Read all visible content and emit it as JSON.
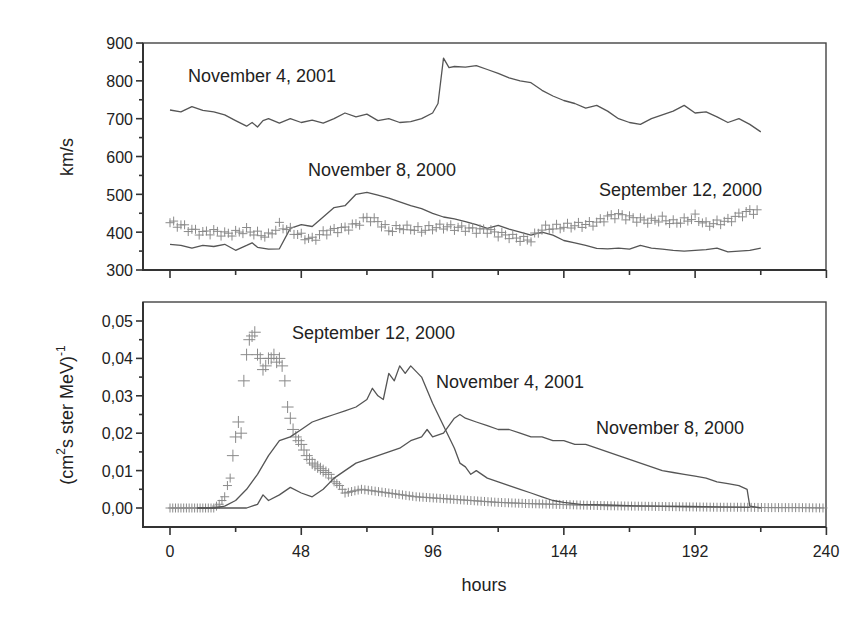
{
  "chart_data": [
    {
      "type": "line",
      "panel": "top",
      "title": "",
      "xlabel": "",
      "ylabel": "km/s",
      "xlim": [
        -6,
        240
      ],
      "ylim": [
        300,
        900
      ],
      "xticks": [
        0,
        24,
        48,
        72,
        96,
        120,
        144,
        168,
        192,
        216,
        240
      ],
      "xtick_labels_visible": false,
      "yticks": [
        300,
        400,
        500,
        600,
        700,
        800,
        900
      ],
      "ytick_labels": [
        "300",
        "400",
        "500",
        "600",
        "700",
        "800",
        "900"
      ],
      "grid": false,
      "annotations": [
        {
          "text": "November 4, 2001",
          "x": 6,
          "y": 785
        },
        {
          "text": "November 8, 2000",
          "x": 50,
          "y": 530
        },
        {
          "text": "September 12, 2000",
          "x": 157,
          "y": 455
        }
      ],
      "series": [
        {
          "name": "November 4, 2001",
          "style": "line",
          "x": [
            0,
            4,
            8,
            12,
            16,
            20,
            24,
            28,
            30,
            32,
            34,
            36,
            40,
            44,
            48,
            52,
            56,
            60,
            64,
            68,
            72,
            76,
            80,
            84,
            88,
            92,
            96,
            98,
            100,
            102,
            104,
            108,
            112,
            116,
            120,
            124,
            128,
            132,
            136,
            140,
            144,
            148,
            152,
            156,
            160,
            164,
            168,
            172,
            176,
            180,
            184,
            188,
            192,
            196,
            200,
            204,
            208,
            212,
            216
          ],
          "y": [
            723,
            718,
            732,
            722,
            718,
            710,
            695,
            680,
            690,
            678,
            695,
            700,
            688,
            700,
            690,
            696,
            688,
            700,
            715,
            705,
            712,
            695,
            700,
            690,
            692,
            700,
            715,
            740,
            860,
            835,
            838,
            836,
            840,
            830,
            820,
            808,
            800,
            795,
            775,
            760,
            748,
            740,
            728,
            735,
            720,
            700,
            690,
            685,
            700,
            710,
            720,
            735,
            715,
            718,
            705,
            690,
            700,
            685,
            665
          ]
        },
        {
          "name": "November 8, 2000",
          "style": "line",
          "x": [
            0,
            4,
            8,
            12,
            16,
            20,
            24,
            28,
            30,
            32,
            36,
            40,
            44,
            48,
            52,
            56,
            60,
            64,
            68,
            72,
            76,
            80,
            84,
            88,
            92,
            96,
            100,
            104,
            108,
            112,
            116,
            120,
            124,
            128,
            132,
            136,
            140,
            144,
            148,
            152,
            156,
            160,
            164,
            168,
            172,
            176,
            180,
            184,
            188,
            192,
            196,
            200,
            204,
            208,
            212,
            216
          ],
          "y": [
            368,
            365,
            358,
            365,
            362,
            368,
            352,
            365,
            372,
            360,
            355,
            356,
            410,
            420,
            415,
            440,
            465,
            470,
            500,
            505,
            498,
            490,
            480,
            470,
            462,
            450,
            440,
            435,
            428,
            420,
            410,
            418,
            408,
            400,
            392,
            400,
            392,
            378,
            372,
            365,
            357,
            356,
            358,
            355,
            365,
            358,
            355,
            352,
            350,
            352,
            354,
            358,
            348,
            350,
            352,
            358
          ]
        },
        {
          "name": "September 12, 2000",
          "style": "cross",
          "x": [
            0,
            4,
            8,
            12,
            16,
            20,
            24,
            28,
            32,
            36,
            40,
            44,
            48,
            52,
            56,
            60,
            64,
            68,
            72,
            76,
            80,
            84,
            88,
            92,
            96,
            100,
            104,
            108,
            112,
            116,
            120,
            124,
            128,
            132,
            136,
            140,
            144,
            148,
            152,
            156,
            160,
            164,
            168,
            172,
            176,
            180,
            184,
            188,
            192,
            196,
            200,
            204,
            208,
            212,
            216
          ],
          "y": [
            425,
            418,
            405,
            398,
            402,
            395,
            398,
            405,
            395,
            390,
            418,
            405,
            390,
            380,
            398,
            405,
            410,
            420,
            438,
            428,
            405,
            412,
            410,
            405,
            412,
            415,
            412,
            410,
            405,
            405,
            395,
            390,
            382,
            380,
            410,
            412,
            415,
            418,
            420,
            425,
            440,
            445,
            438,
            432,
            430,
            435,
            425,
            430,
            440,
            420,
            425,
            430,
            445,
            455,
            455
          ]
        }
      ]
    },
    {
      "type": "line",
      "panel": "bottom",
      "title": "",
      "xlabel": "hours",
      "ylabel": "(cm²s ster MeV)⁻¹",
      "xlim": [
        -6,
        240
      ],
      "ylim": [
        -0.005,
        0.056
      ],
      "xticks": [
        0,
        24,
        48,
        72,
        96,
        120,
        144,
        168,
        192,
        216,
        240
      ],
      "xtick_labels": [
        "0",
        "48",
        "96",
        "144",
        "192",
        "240"
      ],
      "yticks": [
        0.0,
        0.01,
        0.02,
        0.03,
        0.04,
        0.05
      ],
      "ytick_labels": [
        "0,00",
        "0,01",
        "0,02",
        "0,03",
        "0,04",
        "0,05"
      ],
      "grid": false,
      "annotations": [
        {
          "text": "September 12, 2000",
          "x": 44,
          "y": 0.047
        },
        {
          "text": "November 4, 2001",
          "x": 96,
          "y": 0.034
        },
        {
          "text": "November 8, 2000",
          "x": 155,
          "y": 0.021
        }
      ],
      "series": [
        {
          "name": "September 12, 2000",
          "style": "cross",
          "x": [
            0,
            2,
            4,
            6,
            8,
            10,
            12,
            14,
            16,
            18,
            19,
            20,
            21,
            22,
            23,
            24,
            25,
            26,
            27,
            28,
            29,
            30,
            31,
            32,
            33,
            34,
            35,
            36,
            37,
            38,
            39,
            40,
            41,
            42,
            43,
            44,
            45,
            46,
            48,
            50,
            52,
            54,
            56,
            58,
            60,
            62,
            64,
            70,
            80,
            90,
            100,
            110,
            120,
            130,
            140,
            150,
            160,
            170,
            180,
            190,
            200,
            210,
            220,
            230,
            240
          ],
          "y": [
            0.0,
            0.0,
            0.0,
            0.0,
            0.0,
            0.0,
            0.0,
            0.0,
            0.0,
            0.001,
            0.002,
            0.003,
            0.006,
            0.008,
            0.014,
            0.019,
            0.023,
            0.02,
            0.034,
            0.041,
            0.045,
            0.046,
            0.047,
            0.041,
            0.04,
            0.037,
            0.038,
            0.04,
            0.04,
            0.041,
            0.039,
            0.04,
            0.038,
            0.034,
            0.027,
            0.024,
            0.021,
            0.019,
            0.017,
            0.014,
            0.012,
            0.011,
            0.01,
            0.009,
            0.007,
            0.006,
            0.004,
            0.005,
            0.004,
            0.003,
            0.0025,
            0.002,
            0.0015,
            0.0012,
            0.001,
            0.0008,
            0.0006,
            0.0005,
            0.0004,
            0.0003,
            0.0002,
            0.0002,
            0.0001,
            0.0001,
            0.0
          ]
        },
        {
          "name": "November 4, 2001",
          "style": "line",
          "x": [
            10,
            16,
            20,
            24,
            28,
            32,
            36,
            40,
            44,
            48,
            52,
            56,
            60,
            64,
            68,
            72,
            74,
            76,
            78,
            80,
            82,
            84,
            86,
            88,
            92,
            96,
            100,
            104,
            106,
            108,
            110,
            112,
            116,
            120,
            124,
            128,
            132,
            136,
            140,
            144,
            150,
            160,
            170,
            180,
            190,
            200,
            212
          ],
          "y": [
            0.0,
            0.0,
            0.0005,
            0.002,
            0.005,
            0.009,
            0.014,
            0.018,
            0.019,
            0.021,
            0.023,
            0.024,
            0.025,
            0.026,
            0.027,
            0.029,
            0.032,
            0.03,
            0.029,
            0.036,
            0.034,
            0.038,
            0.036,
            0.038,
            0.035,
            0.028,
            0.022,
            0.016,
            0.012,
            0.011,
            0.009,
            0.01,
            0.008,
            0.007,
            0.006,
            0.005,
            0.004,
            0.003,
            0.002,
            0.0015,
            0.001,
            0.0008,
            0.0006,
            0.0005,
            0.0004,
            0.0003,
            0.0002
          ]
        },
        {
          "name": "November 8, 2000",
          "style": "line",
          "x": [
            10,
            20,
            28,
            32,
            34,
            36,
            40,
            44,
            48,
            52,
            56,
            60,
            64,
            68,
            72,
            76,
            80,
            84,
            88,
            92,
            94,
            96,
            100,
            104,
            106,
            108,
            112,
            116,
            120,
            124,
            128,
            132,
            136,
            140,
            144,
            148,
            152,
            156,
            160,
            164,
            168,
            172,
            176,
            180,
            184,
            188,
            192,
            196,
            200,
            204,
            208,
            211,
            212,
            216
          ],
          "y": [
            0.0,
            0.0,
            0.0,
            0.001,
            0.0035,
            0.002,
            0.0035,
            0.0055,
            0.004,
            0.003,
            0.005,
            0.008,
            0.01,
            0.012,
            0.013,
            0.014,
            0.015,
            0.016,
            0.018,
            0.019,
            0.021,
            0.019,
            0.02,
            0.024,
            0.025,
            0.024,
            0.023,
            0.022,
            0.021,
            0.021,
            0.02,
            0.019,
            0.019,
            0.018,
            0.018,
            0.017,
            0.017,
            0.016,
            0.015,
            0.014,
            0.013,
            0.012,
            0.011,
            0.01,
            0.0095,
            0.009,
            0.0085,
            0.008,
            0.007,
            0.0065,
            0.006,
            0.005,
            0.0005,
            0.0
          ]
        }
      ]
    }
  ],
  "figure": {
    "top_panel": {
      "ylabel": "km/s",
      "ytick_labels": [
        "900",
        "800",
        "700",
        "600",
        "500",
        "400",
        "300"
      ],
      "annotations": {
        "nov4": "November 4, 2001",
        "nov8": "November 8, 2000",
        "sep12": "September 12, 2000"
      }
    },
    "bottom_panel": {
      "ylabel_main": "(cm",
      "ylabel_sup2": "2",
      "ylabel_rest": "s ster MeV)",
      "ylabel_sup_minus1": "-1",
      "ytick_labels": [
        "0,05",
        "0,04",
        "0,03",
        "0,02",
        "0,01",
        "0,00"
      ],
      "xtick_labels": [
        "0",
        "48",
        "96",
        "144",
        "192",
        "240"
      ],
      "xlabel": "hours",
      "annotations": {
        "sep12": "September 12, 2000",
        "nov4": "November 4, 2001",
        "nov8": "November 8, 2000"
      }
    },
    "colors": {
      "line": "#555555",
      "cross": "#8a8a8a",
      "axis": "#333333",
      "text": "#222222"
    }
  }
}
